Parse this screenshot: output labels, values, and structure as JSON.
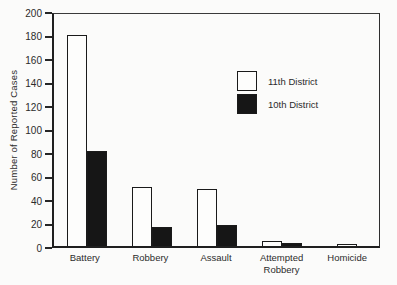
{
  "chart_data": {
    "type": "bar",
    "title": "",
    "xlabel": "",
    "ylabel": "Number of Reported Cases",
    "ylim": [
      0,
      200
    ],
    "yticks": [
      0,
      20,
      40,
      60,
      80,
      100,
      120,
      140,
      160,
      180,
      200
    ],
    "grid": false,
    "legend_position": "inside-upper-right",
    "categories": [
      "Battery",
      "Robbery",
      "Assault",
      "Attempted Robbery",
      "Homicide"
    ],
    "series": [
      {
        "name": "11th District",
        "color": "#fdfdfc",
        "values": [
          182,
          51,
          49,
          4,
          2
        ]
      },
      {
        "name": "10th District",
        "color": "#161616",
        "values": [
          82,
          16,
          18,
          3,
          0
        ]
      }
    ]
  },
  "colors": {
    "background": "#fbfbfa",
    "outline": "#1a1a1a",
    "axis": "#1f1f1f"
  }
}
